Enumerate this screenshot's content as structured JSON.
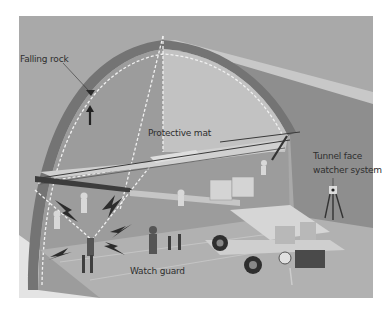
{
  "figure": {
    "type": "illustration",
    "palette": {
      "background": "#ffffff",
      "scene_bg": "#a8a8a8",
      "arch_ring": "#7a7a7a",
      "face": "#9a9a9a",
      "floor": "#b4b4b4",
      "dash": "#f2f2f2",
      "dark": "#3a3a3a"
    }
  },
  "labels": {
    "falling_rock": "Falling rock",
    "protective_mat": "Protective mat",
    "tunnel_face_line1": "Tunnel face",
    "tunnel_face_line2": "watcher system",
    "watch_guard": "Watch guard"
  }
}
